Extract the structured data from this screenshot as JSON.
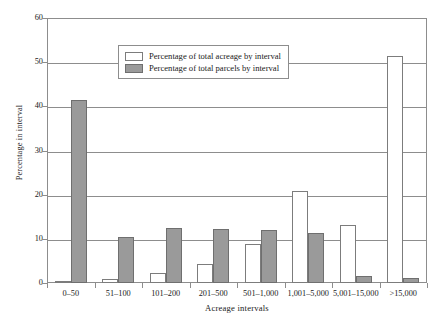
{
  "chart_data": {
    "type": "bar",
    "title": "",
    "xlabel": "Acreage intervals",
    "ylabel": "Percentage in interval",
    "categories": [
      "0–50",
      "51–100",
      "101–200",
      "201–500",
      "501–1,000",
      "1,001–5,000",
      "5,001–15,000",
      ">15,000"
    ],
    "series": [
      {
        "name": "Percentage of total acreage by interval",
        "color": "#ffffff",
        "values": [
          0.5,
          0.8,
          2.2,
          4.2,
          8.8,
          20.8,
          13.2,
          51.5
        ]
      },
      {
        "name": "Percentage of total parcels by interval",
        "color": "#9a9a9a",
        "values": [
          41.5,
          10.5,
          12.4,
          12.3,
          11.9,
          11.3,
          1.7,
          1.2
        ]
      }
    ],
    "ylim": [
      0,
      60
    ],
    "yticks": [
      0,
      10,
      20,
      30,
      40,
      50,
      60
    ],
    "ytick_labels": [
      "0",
      "10",
      "20",
      "30",
      "40",
      "50",
      "60"
    ],
    "grid": "horizontal",
    "legend_position": "upper-center"
  },
  "legend": {
    "entries": [
      {
        "label": "Percentage of total acreage by interval",
        "swatch": "acreage"
      },
      {
        "label": "Percentage of total parcels by interval",
        "swatch": "parcels"
      }
    ]
  }
}
